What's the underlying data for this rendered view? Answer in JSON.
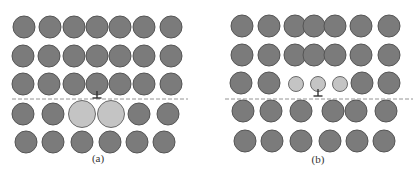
{
  "colors": {
    "atom_fill": "#7b7b7b",
    "atom_stroke": "#555555",
    "solute_fill": "#c4c4c4",
    "solute_stroke": "#6a6a6a",
    "slip_line": "#888888",
    "dislocation": "#333333",
    "label": "#333333"
  },
  "panels": [
    {
      "id": "a",
      "label": "(a)",
      "label_pos": [
        98,
        152
      ],
      "slip_plane": {
        "y": 99,
        "x1": 12,
        "x2": 188
      },
      "dislocation": {
        "x": 97,
        "y": 98
      },
      "atoms": [
        {
          "row": 1,
          "y": 27,
          "r": 11,
          "xs": [
            24,
            50,
            74,
            97,
            120,
            144,
            171
          ]
        },
        {
          "row": 2,
          "y": 56,
          "r": 11,
          "xs": [
            23,
            49,
            74,
            97,
            120,
            144,
            171
          ]
        },
        {
          "row": 3,
          "y": 84,
          "r": 11,
          "xs": [
            23,
            49,
            74,
            97,
            120,
            144,
            171
          ]
        },
        {
          "row": 4,
          "y": 114,
          "r": 11,
          "xs": [
            23,
            53,
            139,
            168
          ]
        },
        {
          "row": 5,
          "y": 142,
          "r": 11,
          "xs": [
            26,
            53,
            82,
            110,
            137,
            164
          ]
        }
      ],
      "solutes": [
        {
          "x": 82,
          "y": 114,
          "r": 13.5,
          "type": "large"
        },
        {
          "x": 111,
          "y": 114,
          "r": 13.5,
          "type": "large"
        }
      ]
    },
    {
      "id": "b",
      "label": "(b)",
      "label_pos": [
        318,
        153
      ],
      "slip_plane": {
        "y": 99,
        "x1": 225,
        "x2": 413
      },
      "dislocation": {
        "x": 318,
        "y": 96
      },
      "atoms": [
        {
          "row": 1,
          "y": 26,
          "r": 11,
          "xs": [
            242,
            269,
            295,
            314,
            335,
            361,
            389
          ]
        },
        {
          "row": 2,
          "y": 55,
          "r": 11,
          "xs": [
            242,
            269,
            295,
            314,
            335,
            361,
            389
          ]
        },
        {
          "row": 3,
          "y": 83,
          "r": 11,
          "xs": [
            241,
            269,
            362,
            389
          ]
        },
        {
          "row": 4,
          "y": 111,
          "r": 11,
          "xs": [
            243,
            271,
            301,
            333,
            356,
            386
          ]
        },
        {
          "row": 5,
          "y": 141,
          "r": 11,
          "xs": [
            245,
            272,
            301,
            330,
            357,
            384
          ]
        }
      ],
      "solutes": [
        {
          "x": 296,
          "y": 84,
          "r": 7.5,
          "type": "small"
        },
        {
          "x": 318,
          "y": 84,
          "r": 7.5,
          "type": "small"
        },
        {
          "x": 340,
          "y": 84,
          "r": 7.5,
          "type": "small"
        }
      ]
    }
  ]
}
